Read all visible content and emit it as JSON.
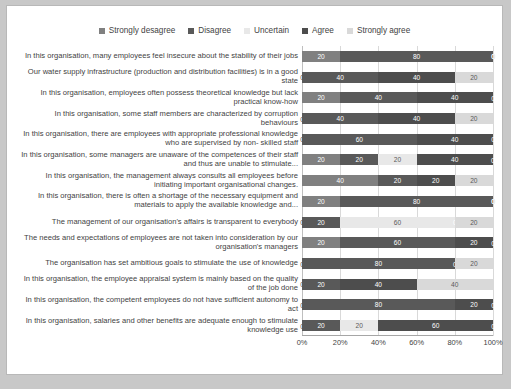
{
  "chart_data": {
    "type": "bar",
    "subtype": "stacked-horizontal-100pct",
    "title": "",
    "xlabel": "",
    "ylabel": "",
    "xlim": [
      0,
      100
    ],
    "xticks": [
      0,
      20,
      40,
      60,
      80,
      100
    ],
    "xtick_labels": [
      "0%",
      "20%",
      "40%",
      "60%",
      "80%",
      "100%"
    ],
    "grid": true,
    "legend_position": "top-center",
    "legend": [
      {
        "label": "Strongly desagree",
        "color": "#808080"
      },
      {
        "label": "Disagree",
        "color": "#595959"
      },
      {
        "label": "Uncertain",
        "color": "#e8e8e8"
      },
      {
        "label": "Agree",
        "color": "#4d4d4d"
      },
      {
        "label": "Strongly agree",
        "color": "#d9d9d9"
      }
    ],
    "colors": [
      "#808080",
      "#595959",
      "#e8e8e8",
      "#4d4d4d",
      "#d9d9d9"
    ],
    "label_colors": [
      "#ffffff",
      "#ffffff",
      "#595959",
      "#ffffff",
      "#595959"
    ],
    "categories": [
      "In this organisation, many employees feel insecure about the stability of their jobs",
      "Our water supply infrastructure (production and distribution facilities) is in a good state",
      "In this organisation, employees often possess theoretical knowledge but lack practical know-how",
      "In this organisation, some staff members are characterized by corruption behaviours",
      "In this organisation, there are employees with appropriate professional knowledge who are supervised by non- skilled staff",
      "In this organisation, some managers are unaware of the competences of their staff and thus are unable to stimulate...",
      "In this organisation, the management always consults all employees before initiating important organisational changes.",
      "In this organisation, there is often a shortage of the necessary equipment and materials to apply the available knowledge and...",
      "The management of our organisation's affairs is transparent to everybody",
      "The needs and expectations of employees are not taken into consideration by our organisation's managers",
      "The organisation has set ambitious goals to stimulate the use of knowledge",
      "In this organisation, the employee appraisal system  is mainly based on the quality of the job done",
      "In this organisation, the competent employees do not have sufficient autonomy to act",
      "In this organisation, salaries and other benefits are adequate enough to stimulate knowledge use"
    ],
    "series": [
      {
        "name": "Strongly desagree",
        "values": [
          20,
          0,
          20,
          0,
          0,
          20,
          40,
          20,
          0,
          20,
          0,
          0,
          0,
          0
        ]
      },
      {
        "name": "Disagree",
        "values": [
          80,
          40,
          40,
          40,
          60,
          20,
          20,
          80,
          20,
          60,
          80,
          20,
          80,
          20
        ]
      },
      {
        "name": "Uncertain",
        "values": [
          0,
          0,
          0,
          0,
          0,
          20,
          0,
          0,
          60,
          0,
          0,
          0,
          0,
          20
        ]
      },
      {
        "name": "Agree",
        "values": [
          0,
          40,
          40,
          40,
          40,
          40,
          20,
          0,
          0,
          20,
          0,
          40,
          20,
          60
        ]
      },
      {
        "name": "Strongly agree",
        "values": [
          0,
          20,
          0,
          20,
          0,
          0,
          20,
          0,
          20,
          0,
          20,
          40,
          0,
          0
        ]
      }
    ]
  }
}
